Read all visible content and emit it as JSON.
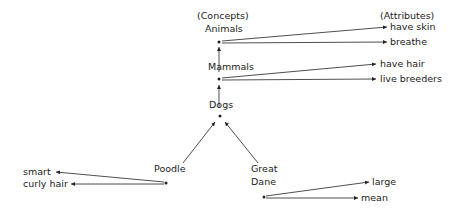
{
  "headers": {
    "concepts": "(Concepts)",
    "attributes": "(Attributes)"
  },
  "nodes": {
    "animals": {
      "label": "Animals",
      "attributes": [
        "have skin",
        "breathe"
      ]
    },
    "mammals": {
      "label": "Mammals",
      "attributes": [
        "have hair",
        "live breeders"
      ]
    },
    "dogs": {
      "label": "Dogs",
      "attributes": []
    },
    "poodle": {
      "label": "Poodle",
      "attributes": [
        "smart",
        "curly hair"
      ]
    },
    "great_dane": {
      "label_line1": "Great",
      "label_line2": "Dane",
      "attributes": [
        "large",
        "mean"
      ]
    }
  },
  "colors": {
    "ink": "#222222",
    "background": "#ffffff"
  }
}
